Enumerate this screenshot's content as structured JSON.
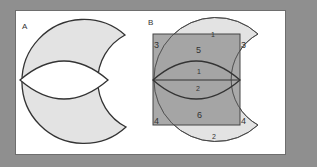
{
  "figure": {
    "panel_a": {
      "label": "A"
    },
    "panel_b": {
      "label": "B",
      "regions": {
        "top_cap": "1",
        "bottom_cap": "2",
        "top_left_corner": "3",
        "top_right_corner": "3",
        "bottom_left_corner": "4",
        "bottom_right_corner": "4",
        "upper_rect": "5",
        "lower_rect": "6",
        "upper_lens": "1",
        "lower_lens": "2"
      }
    }
  },
  "colors": {
    "background": "#8f8f8f",
    "panel": "#ffffff",
    "light_fill": "#e3e3e3",
    "dark_fill": "#9a9a9a",
    "stroke": "#333333"
  }
}
